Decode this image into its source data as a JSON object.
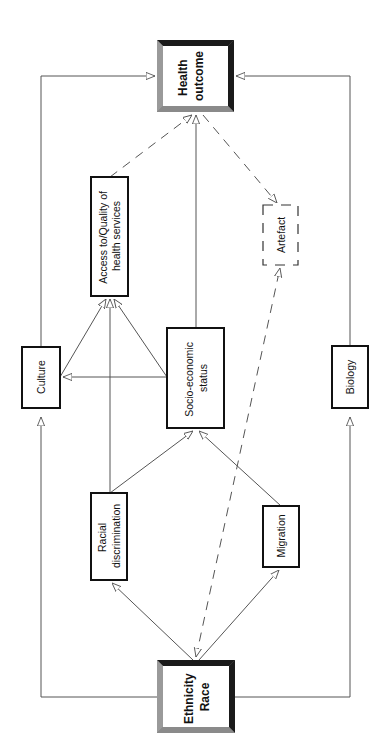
{
  "diagram": {
    "type": "causal-pathway",
    "orientation": "rotated-90-ccw",
    "colors": {
      "line": "#555555",
      "box_border": "#111111",
      "bevel_dark": "#1a1a1a",
      "bevel_mid": "#6e6e6e",
      "bevel_light": "#9a9a9a",
      "background": "#ffffff"
    },
    "nodes": {
      "health_outcome": {
        "lines": [
          "Health",
          "outcome"
        ],
        "bold": true,
        "style": "bevel"
      },
      "ethnicity_race": {
        "lines": [
          "Ethnicity",
          "Race"
        ],
        "bold": true,
        "style": "bevel"
      },
      "access": {
        "lines": [
          "Access to/Quality of",
          "health services"
        ],
        "style": "solid"
      },
      "culture": {
        "lines": [
          "Culture"
        ],
        "style": "solid"
      },
      "socio_economic": {
        "lines": [
          "Socio-economic",
          "status"
        ],
        "style": "solid"
      },
      "artefact": {
        "lines": [
          "Artefact"
        ],
        "style": "dashed"
      },
      "biology": {
        "lines": [
          "Biology"
        ],
        "style": "solid"
      },
      "racial_discrimination": {
        "lines": [
          "Racial",
          "discrimination"
        ],
        "style": "solid"
      },
      "migration": {
        "lines": [
          "Migration"
        ],
        "style": "solid"
      }
    },
    "edges": [
      {
        "from": "ethnicity_race",
        "to": "culture",
        "style": "solid"
      },
      {
        "from": "culture",
        "to": "health_outcome",
        "style": "solid"
      },
      {
        "from": "ethnicity_race",
        "to": "biology",
        "style": "solid"
      },
      {
        "from": "biology",
        "to": "health_outcome",
        "style": "solid"
      },
      {
        "from": "ethnicity_race",
        "to": "racial_discrimination",
        "style": "solid"
      },
      {
        "from": "ethnicity_race",
        "to": "migration",
        "style": "solid"
      },
      {
        "from": "racial_discrimination",
        "to": "socio_economic",
        "style": "solid"
      },
      {
        "from": "migration",
        "to": "socio_economic",
        "style": "solid"
      },
      {
        "from": "racial_discrimination",
        "to": "access",
        "style": "solid"
      },
      {
        "from": "culture",
        "to": "access",
        "style": "solid"
      },
      {
        "from": "socio_economic",
        "to": "access",
        "style": "solid"
      },
      {
        "from": "socio_economic",
        "to": "culture",
        "style": "solid"
      },
      {
        "from": "socio_economic",
        "to": "health_outcome",
        "style": "solid"
      },
      {
        "from": "access",
        "to": "health_outcome",
        "style": "dashed"
      },
      {
        "from": "health_outcome",
        "to": "artefact",
        "style": "dashed"
      },
      {
        "from": "ethnicity_race",
        "to": "artefact",
        "style": "dashed"
      },
      {
        "from": "artefact",
        "to": "ethnicity_race",
        "style": "dashed"
      }
    ]
  }
}
